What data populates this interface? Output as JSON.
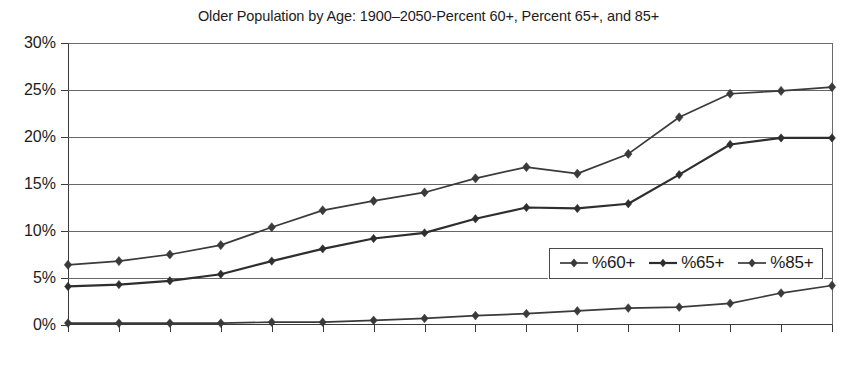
{
  "chart_data": {
    "type": "line",
    "title": "Older Population by Age: 1900–2050-Percent 60+, Percent 65+, and 85+",
    "xlabel": "",
    "ylabel": "",
    "xlim": [
      1900,
      2050
    ],
    "ylim": [
      0,
      30
    ],
    "grid": true,
    "legend_position": "inside-right",
    "x": [
      1900,
      1910,
      1920,
      1930,
      1940,
      1950,
      1960,
      1970,
      1980,
      1990,
      2000,
      2010,
      2020,
      2030,
      2040,
      2050
    ],
    "categories": [
      "1900",
      "1910",
      "1920",
      "1930",
      "1940",
      "1950",
      "1960",
      "1970",
      "1980",
      "1990",
      "2000",
      "2010",
      "2020",
      "2030",
      "2040",
      "2050"
    ],
    "ytick_labels": [
      "0%",
      "5%",
      "10%",
      "15%",
      "20%",
      "25%",
      "30%"
    ],
    "ytick_values": [
      0,
      5,
      10,
      15,
      20,
      25,
      30
    ],
    "series": [
      {
        "name": "%60+",
        "color": "#3a3a3a",
        "values": [
          6.4,
          6.8,
          7.5,
          8.5,
          10.4,
          12.2,
          13.2,
          14.1,
          15.6,
          16.8,
          16.1,
          18.2,
          22.1,
          24.6,
          24.9,
          25.3
        ]
      },
      {
        "name": "%65+",
        "color": "#2e2e2e",
        "values": [
          4.1,
          4.3,
          4.7,
          5.4,
          6.8,
          8.1,
          9.2,
          9.8,
          11.3,
          12.5,
          12.4,
          12.9,
          16.0,
          19.2,
          19.9,
          19.9
        ]
      },
      {
        "name": "%85+",
        "color": "#3a3a3a",
        "values": [
          0.2,
          0.2,
          0.2,
          0.2,
          0.3,
          0.3,
          0.5,
          0.7,
          1.0,
          1.2,
          1.5,
          1.8,
          1.9,
          2.3,
          3.4,
          4.2
        ]
      }
    ]
  },
  "legend": {
    "items": [
      {
        "label": "%60+"
      },
      {
        "label": "%65+"
      },
      {
        "label": "%85+"
      }
    ]
  },
  "colors": {
    "axis": "#3a3a3a",
    "grid": "#666666",
    "background": "#ffffff",
    "text": "#1c1c1c"
  }
}
